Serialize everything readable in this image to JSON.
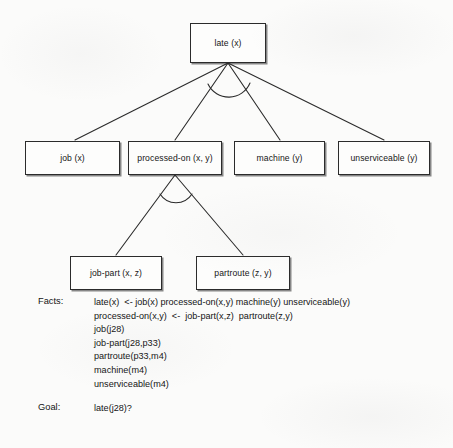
{
  "figure": {
    "diagram_type": "and-or-goal-tree",
    "colors": {
      "background": "#fbfbfa",
      "ink": "#1a1a1a",
      "node_fill": "#fdfdfc",
      "node_border": "#2b2b2b"
    },
    "nodes": [
      {
        "id": "late",
        "label": "late (x)",
        "x": 190,
        "y": 23,
        "w": 76,
        "h": 40
      },
      {
        "id": "job",
        "label": "job (x)",
        "x": 25,
        "y": 141,
        "w": 95,
        "h": 34
      },
      {
        "id": "processed-on",
        "label": "processed-on (x, y)",
        "x": 128,
        "y": 141,
        "w": 94,
        "h": 34
      },
      {
        "id": "machine",
        "label": "machine (y)",
        "x": 234,
        "y": 141,
        "w": 91,
        "h": 34
      },
      {
        "id": "unserviceable",
        "label": "unserviceable (y)",
        "x": 338,
        "y": 141,
        "w": 92,
        "h": 34
      },
      {
        "id": "job-part",
        "label": "job-part (x, z)",
        "x": 70,
        "y": 256,
        "w": 92,
        "h": 34
      },
      {
        "id": "partroute",
        "label": "partroute (z, y)",
        "x": 196,
        "y": 256,
        "w": 94,
        "h": 34
      }
    ],
    "edges": [
      {
        "from": "late",
        "to": "job",
        "kind": "and"
      },
      {
        "from": "late",
        "to": "processed-on",
        "kind": "and"
      },
      {
        "from": "late",
        "to": "machine",
        "kind": "and"
      },
      {
        "from": "late",
        "to": "unserviceable",
        "kind": "and"
      },
      {
        "from": "processed-on",
        "to": "job-part",
        "kind": "and"
      },
      {
        "from": "processed-on",
        "to": "partroute",
        "kind": "and"
      }
    ],
    "and_arcs": [
      {
        "at": "late",
        "note": "arc joining the four child links"
      },
      {
        "at": "processed-on",
        "note": "arc joining the two child links"
      }
    ]
  },
  "clauses": {
    "facts": {
      "tag": "Facts:",
      "lines": [
        "late(x)  <- job(x) processed-on(x,y) machine(y) unserviceable(y)",
        "processed-on(x,y)  <-  job-part(x,z)  partroute(z,y)",
        "job(j28)",
        "job-part(j28,p33)",
        "partroute(p33,m4)",
        "machine(m4)",
        "unserviceable(m4)"
      ]
    },
    "goal": {
      "tag": "Goal:",
      "lines": [
        "late(j28)?"
      ]
    }
  }
}
